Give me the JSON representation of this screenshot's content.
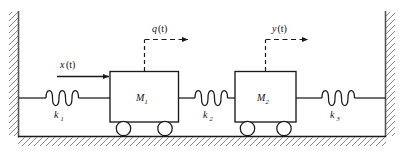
{
  "figure": {
    "kind": "free-body-diagram"
  },
  "colors": {
    "stroke": "#1a1a1a",
    "hatch": "#777777",
    "wall_line": "#555555",
    "background": "#ffffff",
    "box_fill": "#ffffff",
    "wheel_fill": "#ffffff"
  },
  "walls": {
    "left": {
      "name": "left-wall",
      "hatch_side": "left"
    },
    "right": {
      "name": "right-wall",
      "hatch_side": "right"
    }
  },
  "ground": {
    "name": "ground",
    "hatch_side": "below"
  },
  "masses": [
    {
      "id": "m1",
      "label": "M",
      "subscript": "1",
      "wheels": 2
    },
    {
      "id": "m2",
      "label": "M",
      "subscript": "2",
      "wheels": 2
    }
  ],
  "springs": [
    {
      "id": "k1",
      "label": "k",
      "subscript": "1",
      "coils": 4
    },
    {
      "id": "k2",
      "label": "k",
      "subscript": "2",
      "coils": 4
    },
    {
      "id": "k3",
      "label": "k",
      "subscript": "3",
      "coils": 4
    }
  ],
  "arrows": [
    {
      "id": "x",
      "label": "x",
      "argument": "(t)",
      "style": "solid",
      "direction": "right",
      "description": "input force arrow into M1"
    },
    {
      "id": "q",
      "label": "q",
      "argument": "(t)",
      "style": "dashed",
      "direction": "right",
      "description": "displacement of M1"
    },
    {
      "id": "y",
      "label": "y",
      "argument": "(t)",
      "style": "dashed",
      "direction": "right",
      "description": "displacement of M2"
    }
  ]
}
